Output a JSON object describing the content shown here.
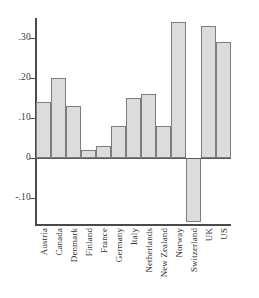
{
  "chart_data": {
    "type": "bar",
    "title": "",
    "subtitle": "",
    "xlabel": "",
    "ylabel": "",
    "categories": [
      "Austria",
      "Canada",
      "Denmark",
      "Finland",
      "France",
      "Germany",
      "Italy",
      "Netherlands",
      "New Zealand",
      "Norway",
      "Switzerland",
      "UK",
      "US"
    ],
    "values": [
      0.14,
      0.2,
      0.13,
      0.02,
      0.03,
      0.08,
      0.15,
      0.16,
      0.08,
      0.34,
      -0.16,
      0.33,
      0.29
    ],
    "ylim": [
      -0.17,
      0.36
    ],
    "ytick_values": [
      0.3,
      0.2,
      0.1,
      0.0,
      -0.1
    ],
    "ytick_labels": [
      ".30",
      ".20",
      ".10",
      "0",
      "-.10"
    ],
    "grid": false,
    "legend": false,
    "legend_position": "none",
    "bar_fill_color": "#dcdcdc",
    "bar_edge_color": "#7d7d7d",
    "axis_color": "#4a4a4a",
    "zero_line": 0
  }
}
